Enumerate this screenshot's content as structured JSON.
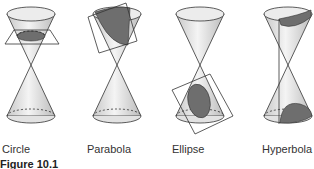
{
  "figure": {
    "caption": "Figure 10.1",
    "panels": [
      {
        "id": "circle",
        "label": "Circle"
      },
      {
        "id": "parabola",
        "label": "Parabola"
      },
      {
        "id": "ellipse",
        "label": "Ellipse"
      },
      {
        "id": "hyperbola",
        "label": "Hyperbola"
      }
    ]
  },
  "colors": {
    "cone_fill": "#dedede",
    "section_fill": "#6e6e6e",
    "stroke": "#333333"
  }
}
